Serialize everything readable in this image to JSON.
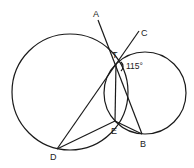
{
  "diagram": {
    "points": {
      "A": {
        "label": "A",
        "x": 98,
        "y": 18
      },
      "C": {
        "label": "C",
        "x": 139,
        "y": 31
      },
      "T": {
        "label": "T",
        "x": 116,
        "y": 64
      },
      "E": {
        "label": "E",
        "x": 115,
        "y": 121
      },
      "B": {
        "label": "B",
        "x": 142,
        "y": 134
      },
      "D": {
        "label": "D",
        "x": 57,
        "y": 149
      }
    },
    "circles": [
      {
        "name": "large-circle",
        "cx": 70,
        "cy": 92,
        "r": 58
      },
      {
        "name": "small-circle",
        "cx": 145,
        "cy": 93,
        "r": 41
      }
    ],
    "angle": {
      "label": "115°",
      "vertex": "T"
    },
    "labels": {
      "A": "A",
      "C": "C",
      "T": "T",
      "E": "E",
      "B": "B",
      "D": "D",
      "angle": "115°"
    }
  }
}
